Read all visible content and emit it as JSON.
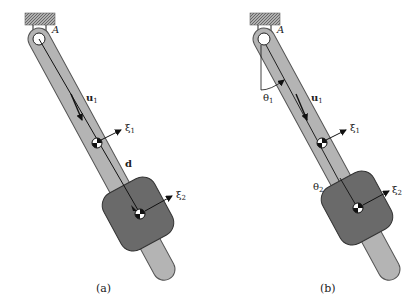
{
  "figure": {
    "panels": [
      {
        "id": "a",
        "caption": "(a)",
        "labels": {
          "pivot": "A",
          "unit_vector": "u",
          "unit_vector_sub": "1",
          "xi1": "ξ",
          "xi1_sub": "1",
          "xi2": "ξ",
          "xi2_sub": "2",
          "displacement": "d"
        }
      },
      {
        "id": "b",
        "caption": "(b)",
        "labels": {
          "pivot": "A",
          "unit_vector": "u",
          "unit_vector_sub": "1",
          "xi1": "ξ",
          "xi1_sub": "1",
          "xi2": "ξ",
          "xi2_sub": "2",
          "theta1": "θ",
          "theta1_sub": "1",
          "theta2": "θ",
          "theta2_sub": "2"
        }
      }
    ],
    "colors": {
      "rod": "#b4b4b4",
      "rod_stroke": "#555555",
      "collar": "#6a6a6a",
      "collar_stroke": "#333333",
      "wall": "#9a9a9a",
      "ink": "#111111"
    }
  }
}
